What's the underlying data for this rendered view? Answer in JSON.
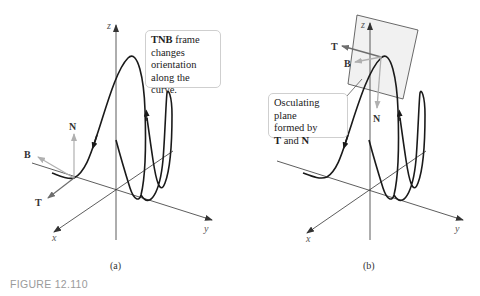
{
  "figure": {
    "label": "FIGURE 12.110",
    "panels": [
      {
        "id": "a",
        "caption": "(a)",
        "axes": {
          "x": "x",
          "y": "y",
          "z": "z"
        },
        "vectors": {
          "T": "T",
          "N": "N",
          "B": "B"
        },
        "callout": {
          "bold": "TNB",
          "line1_rest": " frame",
          "line2": "changes",
          "line3": "orientation",
          "line4": "along the curve."
        }
      },
      {
        "id": "b",
        "caption": "(b)",
        "axes": {
          "x": "x",
          "y": "y",
          "z": "z"
        },
        "vectors": {
          "T": "T",
          "N": "N",
          "B": "B"
        },
        "callout": {
          "line1": "Osculating plane",
          "line2": "formed by",
          "bold1": "T",
          "and": " and ",
          "bold2": "N"
        }
      }
    ]
  },
  "colors": {
    "curve": "#1a1a1a",
    "axis": "#333333",
    "vector_dark": "#6d6d6d",
    "vector_light": "#b0b0b0",
    "plane_fill": "#f1f1f1",
    "callout_border": "#cfcfcf",
    "figure_label": "#9a9a9a"
  }
}
